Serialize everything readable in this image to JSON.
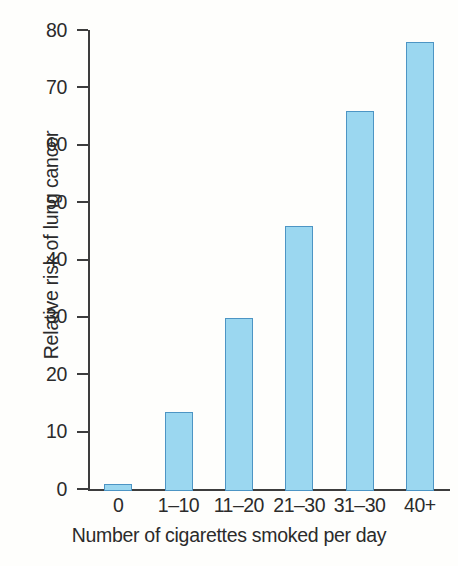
{
  "chart_data": {
    "type": "bar",
    "title": "",
    "xlabel": "Number of cigarettes smoked per day",
    "ylabel": "Relative risk of lung cancer",
    "categories": [
      "0",
      "1–10",
      "11–20",
      "21–30",
      "31–30",
      "40+"
    ],
    "values": [
      1.2,
      13.7,
      30.1,
      46.2,
      66.3,
      78.3
    ],
    "ylim": [
      0,
      80
    ],
    "yticks": [
      0,
      10,
      20,
      30,
      40,
      50,
      60,
      70,
      80
    ],
    "ytick_labels": [
      "0",
      "10",
      "20",
      "30",
      "40",
      "50",
      "60",
      "70",
      "80"
    ],
    "grid": false,
    "legend": "none",
    "bar_fill_color": "#9bd7f0",
    "bar_edge_color": "#4d95c4",
    "axis_color": "#3d3d3d",
    "background_color": "#fefefc",
    "text_color": "#2b2b2b"
  }
}
